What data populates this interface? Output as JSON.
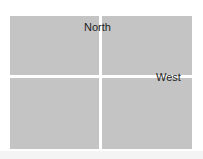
{
  "labels": {
    "north": "North",
    "west": "West"
  },
  "colors": {
    "quadrant_fill": "#c4c4c4",
    "divider": "#ffffff",
    "text": "#1e1e1e"
  }
}
